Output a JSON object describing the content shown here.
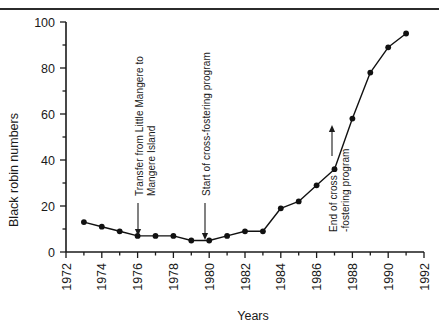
{
  "figure": {
    "has_top_rule": true,
    "background": "#ffffff",
    "line_color": "#111111",
    "axis_color": "#1a1a1a"
  },
  "chart_data": {
    "type": "line",
    "title": "",
    "subtitle": "",
    "xlabel": "Years",
    "ylabel": "Black robin numbers",
    "xlim": [
      1972,
      1992
    ],
    "ylim": [
      0,
      100
    ],
    "grid": false,
    "legend": null,
    "x_ticks": [
      1972,
      1974,
      1976,
      1978,
      1980,
      1982,
      1984,
      1986,
      1988,
      1990,
      1992
    ],
    "x_minor_ticks": [
      1973,
      1975,
      1977,
      1979,
      1981,
      1983,
      1985,
      1987,
      1989,
      1991
    ],
    "y_ticks": [
      0,
      20,
      40,
      60,
      80,
      100
    ],
    "y_minor_ticks": [
      10,
      30,
      50,
      70,
      90
    ],
    "series": [
      {
        "name": "Black robin numbers",
        "marker": "filled-circle",
        "x": [
          1973,
          1974,
          1975,
          1976,
          1977,
          1978,
          1979,
          1980,
          1981,
          1982,
          1983,
          1984,
          1985,
          1986,
          1987,
          1988,
          1989,
          1990,
          1991
        ],
        "values": [
          13,
          11,
          9,
          7,
          7,
          7,
          5,
          5,
          7,
          9,
          9,
          19,
          22,
          29,
          36,
          58,
          78,
          89,
          95
        ]
      }
    ],
    "annotations": [
      {
        "id": "transfer",
        "lines": [
          "Transfer from Little Mangere to",
          "Mangere Island"
        ],
        "points_to_year": 1976,
        "points_to_value": 7
      },
      {
        "id": "start-cross-fostering",
        "lines": [
          "Start of cross-fostering program"
        ],
        "points_to_year": 1980,
        "points_to_value": 5
      },
      {
        "id": "end-cross-fostering",
        "lines": [
          "End of cross",
          "-fostering program"
        ],
        "points_to_year": 1988,
        "points_to_value": 58
      }
    ]
  }
}
